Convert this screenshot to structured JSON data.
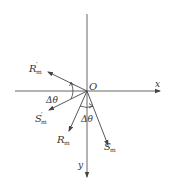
{
  "diagram": {
    "origin_label": "O",
    "axes": {
      "x_label": "x",
      "y_label": "y"
    },
    "vectors": [
      {
        "id": "R_prime_m",
        "main": "R",
        "sub": "m",
        "prime": "′"
      },
      {
        "id": "S_prime_m",
        "main": "S",
        "sub": "m",
        "prime": "′"
      },
      {
        "id": "R_m",
        "main": "R",
        "sub": "m",
        "prime": ""
      },
      {
        "id": "S_m",
        "main": "S",
        "sub": "m",
        "prime": ""
      }
    ],
    "angles": [
      {
        "id": "delta_theta_left",
        "label": "Δθ"
      },
      {
        "id": "delta_theta_bottom",
        "label": "Δθ"
      }
    ],
    "colors": {
      "line": "#444444",
      "text": "#333333",
      "background": "#ffffff"
    }
  }
}
